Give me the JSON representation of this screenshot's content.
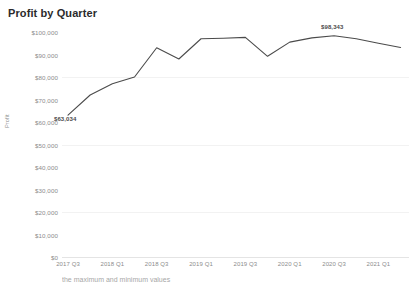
{
  "chart_data": {
    "type": "line",
    "title": "Profit by Quarter",
    "xlabel": "",
    "ylabel": "Profit",
    "ylim": [
      0,
      100000
    ],
    "grid": true,
    "legend": false,
    "y_ticks": [
      "$0",
      "$10,000",
      "$20,000",
      "$30,000",
      "$40,000",
      "$50,000",
      "$60,000",
      "$70,000",
      "$80,000",
      "$90,000",
      "$100,000"
    ],
    "y_tick_values": [
      0,
      10000,
      20000,
      30000,
      40000,
      50000,
      60000,
      70000,
      80000,
      90000,
      100000
    ],
    "x_ticks": [
      "2017 Q3",
      "2018 Q1",
      "2018 Q3",
      "2019 Q1",
      "2019 Q3",
      "2020 Q1",
      "2020 Q3",
      "2021 Q1"
    ],
    "categories": [
      "2017 Q3",
      "2017 Q4",
      "2018 Q1",
      "2018 Q2",
      "2018 Q3",
      "2018 Q4",
      "2019 Q1",
      "2019 Q2",
      "2019 Q3",
      "2019 Q4",
      "2020 Q1",
      "2020 Q2",
      "2020 Q3",
      "2020 Q4",
      "2021 Q1",
      "2021 Q2"
    ],
    "values": [
      63034,
      72000,
      77000,
      80000,
      93000,
      88000,
      97000,
      97200,
      97600,
      89200,
      95500,
      97400,
      98343,
      97000,
      95000,
      93100
    ],
    "series": [
      {
        "name": "Profit",
        "color": "#4b4b4b",
        "values": [
          63034,
          72000,
          77000,
          80000,
          93000,
          88000,
          97000,
          97200,
          97600,
          89200,
          95500,
          97400,
          98343,
          97000,
          95000,
          93100
        ]
      }
    ],
    "annotations": [
      {
        "label": "$63,034",
        "value": 63034,
        "point": "min",
        "category": "2017 Q3"
      },
      {
        "label": "$98,343",
        "value": 98343,
        "point": "max",
        "category": "2020 Q3"
      }
    ]
  },
  "footnote": {
    "text": "the maximum and minimum values"
  }
}
